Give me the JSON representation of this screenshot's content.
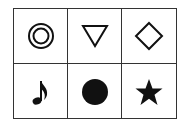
{
  "grid": {
    "rows": 2,
    "cols": 3,
    "cells": [
      {
        "symbol": "double-circle",
        "glyph": "◎"
      },
      {
        "symbol": "down-triangle-outline",
        "glyph": "▽"
      },
      {
        "symbol": "diamond-outline",
        "glyph": "◇"
      },
      {
        "symbol": "eighth-note",
        "glyph": "♪"
      },
      {
        "symbol": "filled-circle",
        "glyph": "●"
      },
      {
        "symbol": "filled-star",
        "glyph": "★"
      }
    ]
  },
  "colors": {
    "stroke": "#111111",
    "border": "#333333",
    "background": "#ffffff"
  }
}
